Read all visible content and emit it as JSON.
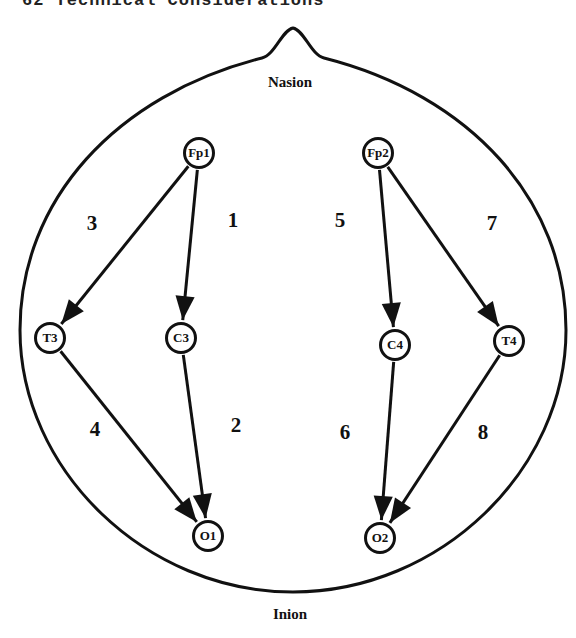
{
  "header": {
    "text": "62    Technical Considerations"
  },
  "landmarks": {
    "nasion": "Nasion",
    "inion": "Inion"
  },
  "electrodes": [
    {
      "id": "Fp1",
      "x": 199,
      "y": 153
    },
    {
      "id": "Fp2",
      "x": 378,
      "y": 153
    },
    {
      "id": "T3",
      "x": 50,
      "y": 338
    },
    {
      "id": "C3",
      "x": 181,
      "y": 338
    },
    {
      "id": "C4",
      "x": 395,
      "y": 345
    },
    {
      "id": "T4",
      "x": 509,
      "y": 341
    },
    {
      "id": "O1",
      "x": 208,
      "y": 536
    },
    {
      "id": "O2",
      "x": 380,
      "y": 538
    }
  ],
  "channels": [
    {
      "number": "1",
      "from": "Fp1",
      "to": "C3",
      "label_x": 233,
      "label_y": 220
    },
    {
      "number": "2",
      "from": "C3",
      "to": "O1",
      "label_x": 236,
      "label_y": 425
    },
    {
      "number": "3",
      "from": "Fp1",
      "to": "T3",
      "label_x": 92,
      "label_y": 223
    },
    {
      "number": "4",
      "from": "T3",
      "to": "O1",
      "label_x": 95,
      "label_y": 429
    },
    {
      "number": "5",
      "from": "Fp2",
      "to": "C4",
      "label_x": 340,
      "label_y": 220
    },
    {
      "number": "6",
      "from": "C4",
      "to": "O2",
      "label_x": 345,
      "label_y": 432
    },
    {
      "number": "7",
      "from": "Fp2",
      "to": "T4",
      "label_x": 492,
      "label_y": 223
    },
    {
      "number": "8",
      "from": "T4",
      "to": "O2",
      "label_x": 483,
      "label_y": 432
    }
  ],
  "colors": {
    "stroke": "#111111",
    "background": "#ffffff"
  }
}
